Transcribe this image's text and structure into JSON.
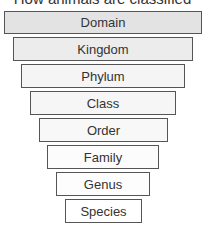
{
  "diagram": {
    "title": "How animals are classified",
    "levels": [
      {
        "label": "Domain",
        "fill": "#e3e3e3",
        "left": 4,
        "top": 11,
        "right": 202,
        "bottom": 34
      },
      {
        "label": "Kingdom",
        "fill": "#ececec",
        "left": 13,
        "top": 37,
        "right": 193,
        "bottom": 61
      },
      {
        "label": "Phylum",
        "fill": "#f5f5f5",
        "left": 21,
        "top": 64,
        "right": 185,
        "bottom": 88
      },
      {
        "label": "Class",
        "fill": "#f6f6f6",
        "left": 30,
        "top": 91,
        "right": 176,
        "bottom": 115
      },
      {
        "label": "Order",
        "fill": "#f8f8f8",
        "left": 39,
        "top": 118,
        "right": 168,
        "bottom": 142
      },
      {
        "label": "Family",
        "fill": "#fcfcfc",
        "left": 47,
        "top": 145,
        "right": 159,
        "bottom": 169
      },
      {
        "label": "Genus",
        "fill": "#fdfdfd",
        "left": 56,
        "top": 172,
        "right": 150,
        "bottom": 196
      },
      {
        "label": "Species",
        "fill": "#ffffff",
        "left": 65,
        "top": 199,
        "right": 142,
        "bottom": 223
      }
    ]
  }
}
